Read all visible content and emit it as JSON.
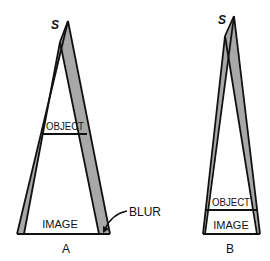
{
  "figure": {
    "colors": {
      "line": "#111111",
      "blur_fill": "#a8a8a8",
      "background": "#ffffff"
    },
    "diagram_a": {
      "caption": "A",
      "source_label": "S",
      "object_label": "OBJECT",
      "image_label": "IMAGE",
      "annotation_label": "BLUR"
    },
    "diagram_b": {
      "caption": "B",
      "source_label": "S",
      "object_label": "OBJECT",
      "image_label": "IMAGE"
    }
  }
}
